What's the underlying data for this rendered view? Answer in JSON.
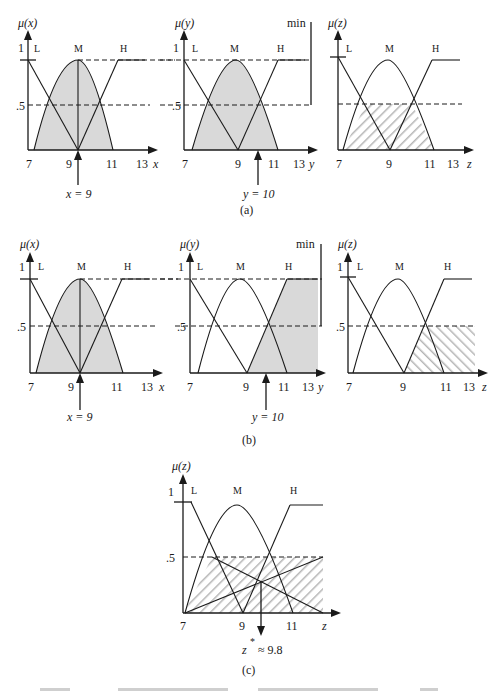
{
  "panels": {
    "a": {
      "caption": "(a)",
      "x_chart": {
        "ylabel": "μ(x)",
        "xlabel": "x",
        "sets": [
          "L",
          "M",
          "H"
        ],
        "ticks": [
          "7",
          "9",
          "11",
          "13"
        ],
        "yticks": [
          "1",
          ".5"
        ],
        "input": "x = 9"
      },
      "y_chart": {
        "ylabel": "μ(y)",
        "xlabel": "y",
        "sets": [
          "L",
          "M",
          "H"
        ],
        "ticks": [
          "7",
          "9",
          "11",
          "13"
        ],
        "yticks": [
          "1",
          ".5"
        ],
        "input": "y = 10",
        "operator": "min"
      },
      "z_chart": {
        "ylabel": "μ(z)",
        "xlabel": "z",
        "sets": [
          "L",
          "M",
          "H"
        ],
        "ticks": [
          "7",
          "9",
          "11",
          "13"
        ],
        "yticks": [
          "1",
          ".5"
        ]
      }
    },
    "b": {
      "caption": "(b)",
      "x_chart": {
        "ylabel": "μ(x)",
        "xlabel": "x",
        "sets": [
          "L",
          "M",
          "H"
        ],
        "ticks": [
          "7",
          "9",
          "11",
          "13"
        ],
        "yticks": [
          "1",
          ".5"
        ],
        "input": "x = 9"
      },
      "y_chart": {
        "ylabel": "μ(y)",
        "xlabel": "y",
        "sets": [
          "L",
          "M",
          "H"
        ],
        "ticks": [
          "7",
          "9",
          "11",
          "13"
        ],
        "yticks": [
          "1",
          ".5"
        ],
        "input": "y = 10",
        "operator": "min"
      },
      "z_chart": {
        "ylabel": "μ(z)",
        "xlabel": "z",
        "sets": [
          "L",
          "M",
          "H"
        ],
        "ticks": [
          "7",
          "9",
          "11",
          "13"
        ],
        "yticks": [
          "1",
          ".5"
        ]
      }
    },
    "c": {
      "caption": "(c)",
      "z_chart": {
        "ylabel": "μ(z)",
        "xlabel": "z",
        "sets": [
          "L",
          "M",
          "H"
        ],
        "ticks": [
          "7",
          "9",
          "11"
        ],
        "yticks": [
          "1",
          ".5"
        ],
        "output_var": "z",
        "output_sup": "*",
        "output_val": "≈ 9.8"
      }
    }
  },
  "colors": {
    "line": "#1a1a1a",
    "fill": "#d9d9d9",
    "hatch": "#b5b5b5",
    "background": "#ffffff"
  }
}
